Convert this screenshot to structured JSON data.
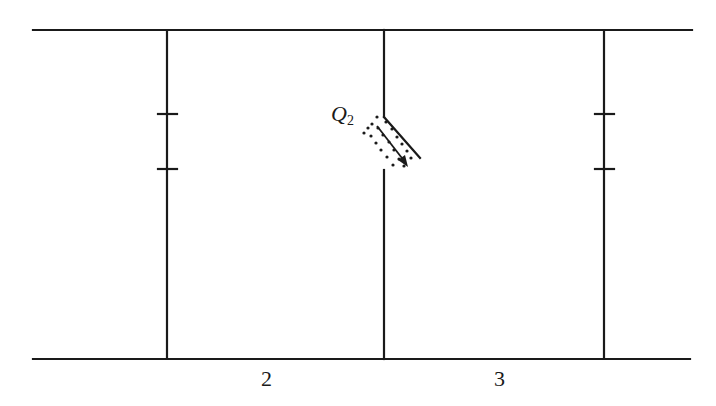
{
  "diagram": {
    "type": "circuit-like schematic with capacitor symbols and a diagonal switch/gap",
    "charge_label": {
      "main": "Q",
      "subscript": "2"
    },
    "region_labels": [
      "2",
      "3"
    ],
    "colors": {
      "line": "#1a1a1a",
      "background": "#ffffff"
    },
    "elements": {
      "top_rail": {
        "x1": 33,
        "x2": 692,
        "y": 30
      },
      "bottom_rail": {
        "x1": 33,
        "x2": 690,
        "y": 359
      },
      "left_branch": {
        "x": 167,
        "plates_y": [
          114,
          169
        ]
      },
      "middle_branch": {
        "x": 384,
        "break_top_y": 117,
        "break_bottom_y": 170,
        "blade_to": [
          420,
          158
        ]
      },
      "right_branch": {
        "x": 604,
        "plates_y": [
          114,
          169
        ]
      }
    }
  }
}
